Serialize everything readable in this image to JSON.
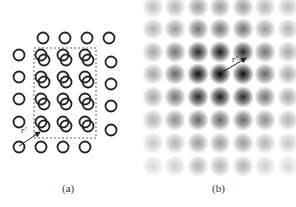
{
  "panels": [
    {
      "id": "a",
      "caption": "(a)",
      "description": "Lattice of open circles with shifted copy inside dashed box and displacement vector r'",
      "vector_label": "r'",
      "grid_spacing_px": 22,
      "colors": {
        "circle": "#222222",
        "box": "#666666",
        "arrow": "#222222"
      }
    },
    {
      "id": "b",
      "caption": "(b)",
      "description": "Autocorrelation/Patterson map: grid of Gaussian spots, intensity peaking at center, with vector r'",
      "vector_label": "r'",
      "columns": 7,
      "rows": 8,
      "intensity_rows": [
        [
          0.25,
          0.3,
          0.4,
          0.4,
          0.4,
          0.3,
          0.25
        ],
        [
          0.3,
          0.4,
          0.55,
          0.55,
          0.55,
          0.4,
          0.3
        ],
        [
          0.35,
          0.55,
          0.85,
          0.9,
          0.85,
          0.55,
          0.35
        ],
        [
          0.35,
          0.6,
          0.95,
          1.0,
          0.95,
          0.6,
          0.35
        ],
        [
          0.35,
          0.55,
          0.85,
          0.9,
          0.85,
          0.55,
          0.35
        ],
        [
          0.3,
          0.45,
          0.6,
          0.6,
          0.6,
          0.45,
          0.3
        ],
        [
          0.22,
          0.3,
          0.4,
          0.4,
          0.4,
          0.3,
          0.22
        ],
        [
          0.15,
          0.2,
          0.3,
          0.3,
          0.3,
          0.2,
          0.15
        ]
      ]
    }
  ]
}
